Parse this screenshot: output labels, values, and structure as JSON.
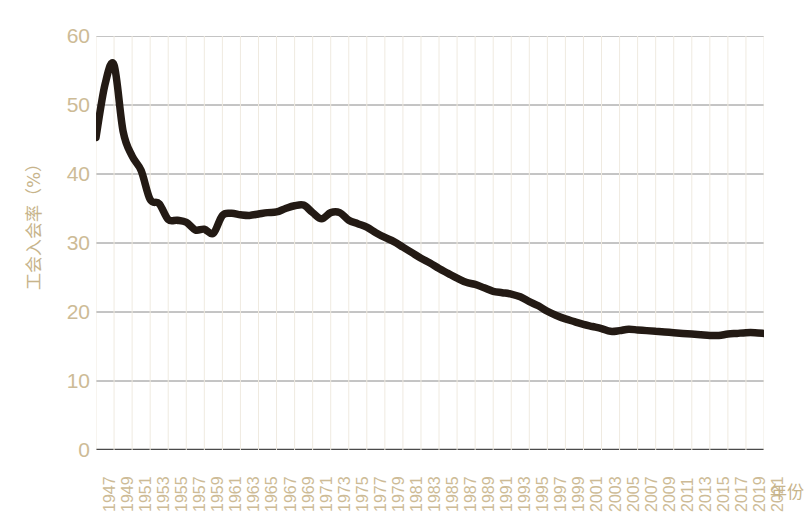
{
  "chart_data": {
    "type": "line",
    "title": "",
    "xlabel": "年份",
    "ylabel": "工会入会率（%）",
    "ylim": [
      0,
      60
    ],
    "yticks": [
      0,
      10,
      20,
      30,
      40,
      50,
      60
    ],
    "ytick_labels": [
      "0",
      "10",
      "20",
      "30",
      "40",
      "50",
      "60"
    ],
    "xlim": [
      1947,
      2021
    ],
    "xticks": [
      1947,
      1949,
      1951,
      1953,
      1955,
      1957,
      1959,
      1961,
      1963,
      1965,
      1967,
      1969,
      1971,
      1973,
      1975,
      1977,
      1979,
      1981,
      1983,
      1985,
      1987,
      1989,
      1991,
      1993,
      1995,
      1997,
      1999,
      2001,
      2003,
      2005,
      2007,
      2009,
      2011,
      2013,
      2015,
      2017,
      2019,
      2021
    ],
    "xtick_labels": [
      "1947",
      "1949",
      "1951",
      "1953",
      "1955",
      "1957",
      "1959",
      "1961",
      "1963",
      "1965",
      "1967",
      "1969",
      "1971",
      "1973",
      "1975",
      "1977",
      "1979",
      "1981",
      "1983",
      "1985",
      "1987",
      "1989",
      "1991",
      "1993",
      "1995",
      "1997",
      "1999",
      "2001",
      "2003",
      "2005",
      "2007",
      "2009",
      "2011",
      "2013",
      "2015",
      "2017",
      "2019",
      "2021"
    ],
    "grid": true,
    "grid_axis": "y",
    "legend": false,
    "line_color": "#231a14",
    "axis_label_color": "#cdbb96",
    "grid_color": "#8a8a8a",
    "background_color": "#ffffff",
    "series": [
      {
        "name": "工会入会率",
        "x": [
          1947,
          1948,
          1949,
          1950,
          1951,
          1952,
          1953,
          1954,
          1955,
          1956,
          1957,
          1958,
          1959,
          1960,
          1961,
          1962,
          1963,
          1964,
          1965,
          1966,
          1967,
          1968,
          1969,
          1970,
          1971,
          1972,
          1973,
          1974,
          1975,
          1976,
          1977,
          1978,
          1979,
          1980,
          1981,
          1982,
          1983,
          1984,
          1985,
          1986,
          1987,
          1988,
          1989,
          1990,
          1991,
          1992,
          1993,
          1994,
          1995,
          1996,
          1997,
          1998,
          1999,
          2000,
          2001,
          2002,
          2003,
          2004,
          2005,
          2006,
          2007,
          2008,
          2009,
          2010,
          2011,
          2012,
          2013,
          2014,
          2015,
          2016,
          2017,
          2018,
          2019,
          2020,
          2021
        ],
        "values": [
          45.3,
          53.0,
          55.8,
          46.2,
          42.6,
          40.5,
          36.3,
          35.7,
          33.4,
          33.3,
          33.0,
          31.9,
          32.0,
          31.4,
          34.0,
          34.3,
          34.1,
          34.0,
          34.2,
          34.4,
          34.5,
          35.0,
          35.4,
          35.5,
          34.4,
          33.5,
          34.4,
          34.4,
          33.3,
          32.8,
          32.3,
          31.5,
          30.8,
          30.2,
          29.4,
          28.6,
          27.8,
          27.1,
          26.3,
          25.6,
          24.9,
          24.3,
          24.0,
          23.5,
          23.0,
          22.8,
          22.6,
          22.2,
          21.5,
          20.9,
          20.1,
          19.5,
          19.0,
          18.6,
          18.2,
          17.9,
          17.6,
          17.2,
          17.3,
          17.5,
          17.4,
          17.3,
          17.2,
          17.1,
          17.0,
          16.9,
          16.8,
          16.7,
          16.6,
          16.6,
          16.8,
          16.9,
          17.0,
          17.0,
          16.9
        ]
      }
    ]
  },
  "axis": {
    "y_title": "工会入会率（%）",
    "x_title": "年份"
  }
}
